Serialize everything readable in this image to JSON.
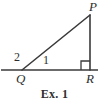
{
  "figure": {
    "caption": "Ex. 1",
    "background_color": "#ffffff",
    "stroke_color": "#3a3a3a",
    "labels": {
      "apex": "P",
      "left_vertex": "Q",
      "right_vertex": "R",
      "angle_outer": "2",
      "angle_inner": "1"
    },
    "geometry": {
      "type": "right-triangle-with-extended-base",
      "points": {
        "P": [
          90,
          15
        ],
        "Q": [
          22,
          70
        ],
        "R": [
          90,
          70
        ]
      },
      "baseline": {
        "x1": 1,
        "y1": 70,
        "x2": 98,
        "y2": 70
      },
      "right_angle_marker": {
        "at": "R",
        "size": 9
      }
    }
  }
}
